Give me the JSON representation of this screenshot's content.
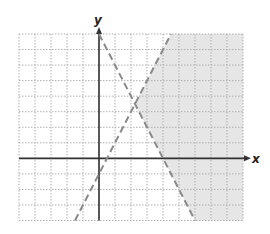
{
  "chart_data": {
    "type": "line",
    "title": "",
    "xlabel": "x",
    "ylabel": "y",
    "xlim": [
      -5,
      9
    ],
    "ylim": [
      -4,
      8
    ],
    "grid": true,
    "grid_step": 1,
    "tick_labels": false,
    "series": [
      {
        "name": "boundary-increasing",
        "equation": "y = 2x - 1",
        "style": "dashed",
        "points": [
          [
            -1.5,
            -4
          ],
          [
            4.5,
            8
          ]
        ]
      },
      {
        "name": "boundary-decreasing",
        "equation": "y = -2x + 8",
        "style": "dashed",
        "points": [
          [
            0,
            8
          ],
          [
            6,
            -4
          ]
        ]
      }
    ],
    "shaded_region": {
      "description": "Region to the right of both dashed lines: y < 2x - 1 and y > -2x + 8",
      "vertices": [
        [
          2.25,
          3.5
        ],
        [
          4.5,
          8
        ],
        [
          9,
          8
        ],
        [
          9,
          -4
        ],
        [
          6,
          -4
        ]
      ],
      "color": "#e6e6e6"
    },
    "intersection": [
      2.25,
      3.5
    ]
  },
  "labels": {
    "x_axis": "x",
    "y_axis": "y"
  },
  "colors": {
    "shade": "#e6e6e6",
    "grid": "#b0b0b0",
    "axis": "#333333",
    "dashed_line": "#8a8a8a"
  }
}
